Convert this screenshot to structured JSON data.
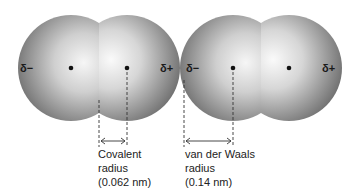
{
  "figure": {
    "molecules": [
      {
        "name": "molecule-1",
        "atoms": [
          {
            "cx": 71,
            "cy": 68,
            "r": 53,
            "charge": "δ−",
            "charge_x": 27,
            "charge_y": 72
          },
          {
            "cx": 127,
            "cy": 68,
            "r": 53,
            "charge": "δ+",
            "charge_x": 165,
            "charge_y": 72
          }
        ]
      },
      {
        "name": "molecule-2",
        "atoms": [
          {
            "cx": 233,
            "cy": 68,
            "r": 53,
            "charge": "δ−",
            "charge_x": 189,
            "charge_y": 72
          },
          {
            "cx": 289,
            "cy": 68,
            "r": 53,
            "charge": "δ+",
            "charge_x": 327,
            "charge_y": 72
          }
        ]
      }
    ],
    "measurements": [
      {
        "name": "covalent-radius",
        "x1": 99,
        "x2": 127,
        "lines": [
          "Covalent",
          "radius",
          "(0.062 nm)"
        ]
      },
      {
        "name": "van-der-waals-radius",
        "x1": 184,
        "x2": 233,
        "lines": [
          "van der Waals",
          "radius",
          "(0.14 nm)"
        ]
      }
    ],
    "colors": {
      "sphere_light": "#f4f4f4",
      "sphere_mid": "#b8b8b8",
      "sphere_dark": "#6e6e6e",
      "ink": "#1a1a1a"
    }
  }
}
